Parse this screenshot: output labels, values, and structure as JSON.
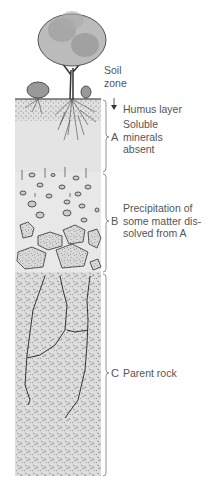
{
  "diagram": {
    "type": "soil-profile",
    "top_label": {
      "line1": "Soil",
      "line2": "zone"
    },
    "humus_label": "Humus layer",
    "horizons": [
      {
        "letter": "A",
        "lines": [
          "Soluble",
          "minerals",
          "absent"
        ]
      },
      {
        "letter": "B",
        "lines": [
          "Precipitation of",
          "some matter dis-",
          "solved from A"
        ]
      },
      {
        "letter": "C",
        "lines": [
          "Parent rock"
        ]
      }
    ],
    "colors": {
      "background": "#ffffff",
      "horizon_a_fill": "#e4e4e4",
      "horizon_b_fill": "#e8e8e8",
      "horizon_c_fill": "#dcdcdc",
      "ink": "#333333",
      "text": "#555555"
    }
  }
}
